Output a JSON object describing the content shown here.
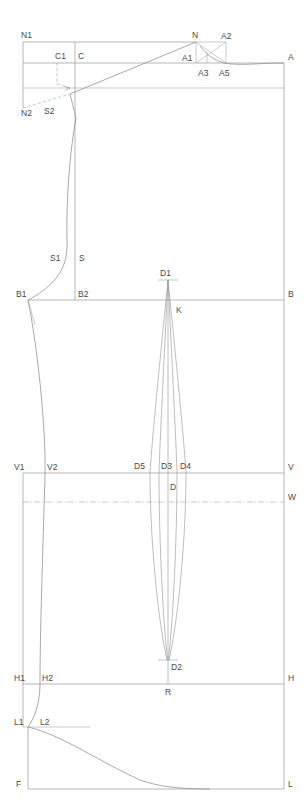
{
  "drawing": {
    "title": "Garment Pattern Draft",
    "type": "technical-pattern-block",
    "canvas": {
      "width": 305,
      "height": 812
    },
    "background_color": "#ffffff",
    "line_color": "#9a9a9a",
    "label_color": "#4a4a4a"
  },
  "labels": {
    "n1": "N1",
    "n2": "N2",
    "c1": "C1",
    "c": "C",
    "s2": "S2",
    "s1": "S1",
    "s": "S",
    "n": "N",
    "a": "A",
    "a1": "A1",
    "a2": "A2",
    "a3": "A3",
    "a5": "A5",
    "b1": "B1",
    "b2": "B2",
    "b": "B",
    "d1": "D1",
    "k": "K",
    "v1": "V1",
    "v2": "V2",
    "v": "V",
    "d5": "D5",
    "d3": "D3",
    "d4": "D4",
    "d": "D",
    "w": "W",
    "d2": "D2",
    "h1": "H1",
    "h2": "H2",
    "h": "H",
    "r": "R",
    "l1": "L1",
    "l2": "L2",
    "f": "F",
    "l": "L"
  },
  "points": {
    "n1": {
      "x": 23,
      "y": 42,
      "label_dx": -2,
      "label_dy": -4
    },
    "n2": {
      "x": 23,
      "y": 108,
      "label_dx": -2,
      "label_dy": 8
    },
    "c1": {
      "x": 57,
      "y": 63,
      "label_dx": -2,
      "label_dy": -4
    },
    "c": {
      "x": 75,
      "y": 63,
      "label_dx": 3,
      "label_dy": -4
    },
    "s2": {
      "x": 70,
      "y": 94,
      "label_dx": -3,
      "label_dy": 10
    },
    "s1": {
      "x": 64,
      "y": 258,
      "label_dx": -13,
      "label_dy": 3
    },
    "s": {
      "x": 75,
      "y": 258,
      "label_dx": 4,
      "label_dy": 3
    },
    "n": {
      "x": 196,
      "y": 42,
      "label_dx": -4,
      "label_dy": -4
    },
    "a": {
      "x": 284,
      "y": 63,
      "label_dx": 4,
      "label_dy": -3
    },
    "a1": {
      "x": 196,
      "y": 63,
      "label_dx": -14,
      "label_dy": -2
    },
    "a2": {
      "x": 226,
      "y": 42,
      "label_dx": 3,
      "label_dy": -3
    },
    "a3": {
      "x": 207,
      "y": 63,
      "label_dx": -5,
      "label_dy": 13
    },
    "a5": {
      "x": 226,
      "y": 63,
      "label_dx": -5,
      "label_dy": 13
    },
    "b1": {
      "x": 28,
      "y": 300,
      "label_dx": -12,
      "label_dy": -3
    },
    "b2": {
      "x": 75,
      "y": 300,
      "label_dx": 3,
      "label_dy": -3
    },
    "b": {
      "x": 284,
      "y": 300,
      "label_dx": 4,
      "label_dy": -3
    },
    "d1": {
      "x": 168,
      "y": 280,
      "label_dx": -4,
      "label_dy": -5
    },
    "k": {
      "x": 172,
      "y": 310,
      "label_dx": 4,
      "label_dy": 3
    },
    "v1": {
      "x": 23,
      "y": 473,
      "label_dx": -2,
      "label_dy": -3
    },
    "v2": {
      "x": 45,
      "y": 473,
      "label_dx": 3,
      "label_dy": -3
    },
    "v": {
      "x": 284,
      "y": 473,
      "label_dx": 4,
      "label_dy": -3
    },
    "d5": {
      "x": 150,
      "y": 473,
      "label_dx": -9,
      "label_dy": -4
    },
    "d3": {
      "x": 168,
      "y": 473,
      "label_dx": -5,
      "label_dy": -4
    },
    "d4": {
      "x": 186,
      "y": 473,
      "label_dx": 2,
      "label_dy": -4
    },
    "d": {
      "x": 168,
      "y": 488,
      "label_dx": 2,
      "label_dy": 2
    },
    "w": {
      "x": 284,
      "y": 502,
      "label_dx": 4,
      "label_dy": -2
    },
    "d2": {
      "x": 168,
      "y": 660,
      "label_dx": 3,
      "label_dy": 6
    },
    "h1": {
      "x": 23,
      "y": 684,
      "label_dx": -2,
      "label_dy": -3
    },
    "h2": {
      "x": 40,
      "y": 684,
      "label_dx": 3,
      "label_dy": -3
    },
    "h": {
      "x": 284,
      "y": 684,
      "label_dx": 4,
      "label_dy": -3
    },
    "r": {
      "x": 168,
      "y": 684,
      "label_dx": -3,
      "label_dy": 11
    },
    "l1": {
      "x": 23,
      "y": 727,
      "label_dx": -2,
      "label_dy": -2
    },
    "l2": {
      "x": 38,
      "y": 727,
      "label_dx": 3,
      "label_dy": -2
    },
    "f": {
      "x": 28,
      "y": 789,
      "label_dx": -10,
      "label_dy": -2
    },
    "l": {
      "x": 284,
      "y": 789,
      "label_dx": 4,
      "label_dy": -2
    }
  },
  "geometry": {
    "horizontal_lines": [
      {
        "name": "n1-line",
        "x1": 23,
        "y": 42,
        "x2": 196
      },
      {
        "name": "c-line",
        "x1": 23,
        "y": 63,
        "x2": 284
      },
      {
        "name": "chest-aux-line",
        "x1": 23,
        "y": 88,
        "x2": 284
      },
      {
        "name": "b-line",
        "x1": 28,
        "y": 300,
        "x2": 284
      },
      {
        "name": "v-line",
        "x1": 23,
        "y": 473,
        "x2": 284
      },
      {
        "name": "h-line",
        "x1": 23,
        "y": 684,
        "x2": 284
      },
      {
        "name": "f-line",
        "x1": 28,
        "y": 789,
        "x2": 284
      },
      {
        "name": "l2-line",
        "x1": 23,
        "y": 727,
        "x2": 90
      }
    ],
    "dashdot_lines": [
      {
        "name": "w-line",
        "x1": 23,
        "y": 502,
        "x2": 284
      }
    ],
    "vertical_lines": [
      {
        "name": "left-edge-upper",
        "x": 23,
        "y1": 42,
        "y2": 108
      },
      {
        "name": "center-back",
        "x": 75,
        "y1": 42,
        "y2": 300
      },
      {
        "name": "right-edge",
        "x": 284,
        "y1": 63,
        "y2": 789
      },
      {
        "name": "left-edge-lower",
        "x": 23,
        "y1": 473,
        "y2": 727
      },
      {
        "name": "f-left-edge",
        "x": 28,
        "y1": 727,
        "y2": 789
      },
      {
        "name": "c1-drop",
        "x": 57,
        "y1": 63,
        "y2": 86
      },
      {
        "name": "n-drop",
        "x": 196,
        "y1": 42,
        "y2": 63
      },
      {
        "name": "a2-drop",
        "x": 226,
        "y1": 42,
        "y2": 63
      },
      {
        "name": "a3-drop",
        "x": 207,
        "y1": 52,
        "y2": 63
      },
      {
        "name": "dart-center",
        "x": 168,
        "y1": 280,
        "y2": 684
      }
    ],
    "construction_lines": [
      {
        "name": "n-to-s2-diagonal",
        "x1": 196,
        "y1": 42,
        "x2": 70,
        "y2": 94
      },
      {
        "name": "n2-to-s2-dashed",
        "x1": 23,
        "y1": 108,
        "x2": 70,
        "y2": 94
      },
      {
        "name": "s2-to-c-shoulder",
        "x1": 70,
        "y1": 94,
        "x2": 75,
        "y2": 110
      },
      {
        "name": "n-to-a1",
        "x1": 196,
        "y1": 42,
        "x2": 196,
        "y2": 63
      },
      {
        "name": "cross-n-a5",
        "x1": 196,
        "y1": 42,
        "x2": 226,
        "y2": 63
      },
      {
        "name": "cross-a1-a2",
        "x1": 196,
        "y1": 63,
        "x2": 226,
        "y2": 42
      },
      {
        "name": "b1-inner-spur",
        "x1": 28,
        "y1": 300,
        "x2": 34,
        "y2": 322
      }
    ],
    "curves": [
      {
        "name": "neck-shoulder-curve",
        "desc": "C down through S to B2 side seam"
      },
      {
        "name": "armhole-curve",
        "desc": "A1 to A via soft concave sweep"
      },
      {
        "name": "side-seam-curve",
        "desc": "B1 through V2 to H2 to L1"
      },
      {
        "name": "hem-curve",
        "desc": "L2 sweeping to F-L baseline"
      }
    ],
    "darts": [
      {
        "name": "waist-dart-upper",
        "apex": "D1",
        "waist": [
          "D5",
          "D3",
          "D4"
        ],
        "tip": "D2"
      }
    ]
  }
}
